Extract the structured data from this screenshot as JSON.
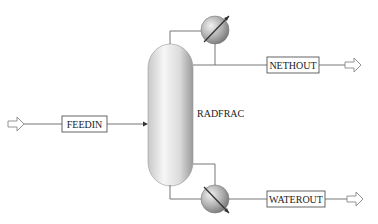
{
  "diagram": {
    "type": "process-flowsheet",
    "block": {
      "id": "RADFRAC",
      "label": "RADFRAC",
      "kind": "distillation-column"
    },
    "streams": [
      {
        "id": "feedin",
        "label": "FEEDIN",
        "direction": "inlet"
      },
      {
        "id": "nethout",
        "label": "NETHOUT",
        "direction": "outlet-top"
      },
      {
        "id": "waterout",
        "label": "WATEROUT",
        "direction": "outlet-bottom"
      }
    ],
    "equipment": [
      {
        "name": "condenser",
        "icon": "heat-exchanger-icon"
      },
      {
        "name": "reboiler",
        "icon": "heat-exchanger-icon"
      }
    ],
    "colors": {
      "vessel_light": "#f4f4f4",
      "vessel_dark": "#9a9a9a",
      "line": "#666666"
    }
  }
}
